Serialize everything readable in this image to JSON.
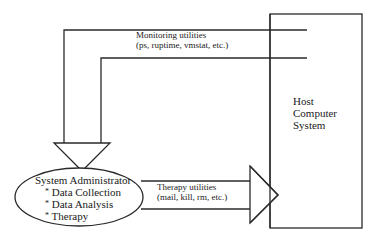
{
  "diagram": {
    "host": {
      "lines": [
        "Host",
        "Computer",
        "System"
      ]
    },
    "monitoring": {
      "title": "Monitoring utilities",
      "detail": "(ps, ruptime, vmstat, etc.)"
    },
    "therapy": {
      "title": "Therapy utilities",
      "detail": "(mail, kill, rm, etc.)"
    },
    "admin": {
      "title": "System Administrator",
      "items": [
        "Data Collection",
        "Data Analysis",
        "Therapy"
      ],
      "bullet": "*"
    },
    "colors": {
      "stroke": "#2a2a2a",
      "background": "#ffffff"
    }
  }
}
